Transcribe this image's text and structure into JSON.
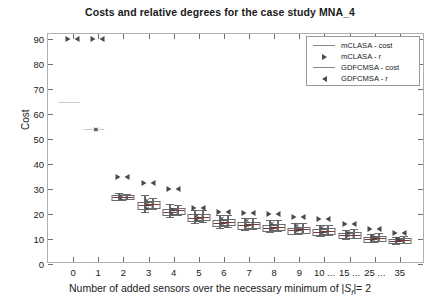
{
  "chart_data": {
    "type": "boxplot",
    "title": "Costs and relative degrees for the case study MNA_4",
    "xlabel": "Number of added sensors over the necessary minimum of |S_f|= 2",
    "xlabel_parts": {
      "pre": "Number of added sensors over the necessary minimum of |",
      "sym": "S",
      "sub": "f",
      "post": "|= 2"
    },
    "ylabel": "Cost",
    "ylim": [
      0,
      92
    ],
    "yticks": [
      0,
      10,
      20,
      30,
      40,
      50,
      60,
      70,
      80,
      90
    ],
    "categories": [
      "0",
      "1",
      "2",
      "3",
      "4",
      "5",
      "6",
      "7",
      "8",
      "9",
      "10",
      "15",
      "25",
      "35"
    ],
    "xtick_labels": [
      "0",
      "1",
      "2",
      "3",
      "4",
      "5",
      "6",
      "7",
      "8",
      "9",
      "10 ...",
      "15 ...",
      "25 ...",
      "35"
    ],
    "grid": false,
    "legend_position": "top-right",
    "legend": [
      {
        "label": "mCLASA - cost",
        "symbol": "line"
      },
      {
        "label": "mCLASA - r",
        "symbol": "triangle-right"
      },
      {
        "label": "GDFCMSA - cost",
        "symbol": "line"
      },
      {
        "label": "GDFCMSA - r",
        "symbol": "triangle-left"
      }
    ],
    "series": [
      {
        "name": "mCLASA - cost",
        "type": "box",
        "boxes": [
          {
            "x": "0",
            "median": 65.0,
            "q1": 65.0,
            "q3": 65.0,
            "low": 65.0,
            "high": 65.0
          },
          {
            "x": "1",
            "median": 54.0,
            "q1": 54.0,
            "q3": 54.0,
            "low": 54.0,
            "high": 54.0
          },
          {
            "x": "2",
            "median": 27.0,
            "q1": 26.2,
            "q3": 27.6,
            "low": 25.5,
            "high": 28.5
          },
          {
            "x": "3",
            "median": 23.5,
            "q1": 22.4,
            "q3": 25.0,
            "low": 21.0,
            "high": 27.5
          },
          {
            "x": "4",
            "median": 21.0,
            "q1": 20.0,
            "q3": 22.0,
            "low": 19.0,
            "high": 24.0
          },
          {
            "x": "5",
            "median": 18.5,
            "q1": 17.5,
            "q3": 20.0,
            "low": 16.5,
            "high": 21.5
          },
          {
            "x": "6",
            "median": 16.5,
            "q1": 15.5,
            "q3": 17.8,
            "low": 14.5,
            "high": 19.5
          },
          {
            "x": "7",
            "median": 15.5,
            "q1": 14.5,
            "q3": 16.8,
            "low": 13.5,
            "high": 18.5
          },
          {
            "x": "8",
            "median": 14.5,
            "q1": 13.6,
            "q3": 15.6,
            "low": 12.8,
            "high": 17.5
          },
          {
            "x": "9",
            "median": 13.5,
            "q1": 12.6,
            "q3": 14.6,
            "low": 12.0,
            "high": 16.5
          },
          {
            "x": "10",
            "median": 13.0,
            "q1": 12.0,
            "q3": 14.0,
            "low": 11.2,
            "high": 15.5
          },
          {
            "x": "15",
            "median": 11.5,
            "q1": 10.8,
            "q3": 12.4,
            "low": 10.0,
            "high": 13.5
          },
          {
            "x": "25",
            "median": 10.0,
            "q1": 9.4,
            "q3": 10.8,
            "low": 9.0,
            "high": 12.0
          },
          {
            "x": "35",
            "median": 9.2,
            "q1": 8.7,
            "q3": 10.0,
            "low": 8.2,
            "high": 11.0
          }
        ]
      },
      {
        "name": "GDFCMSA - cost",
        "type": "box",
        "boxes": [
          {
            "x": "2",
            "median": 27.0,
            "q1": 26.5,
            "q3": 27.5,
            "low": 26.0,
            "high": 28.0
          },
          {
            "x": "3",
            "median": 24.0,
            "q1": 23.0,
            "q3": 25.2,
            "low": 22.0,
            "high": 26.5
          },
          {
            "x": "4",
            "median": 21.5,
            "q1": 20.5,
            "q3": 22.5,
            "low": 19.5,
            "high": 23.5
          },
          {
            "x": "5",
            "median": 19.0,
            "q1": 18.0,
            "q3": 20.2,
            "low": 17.0,
            "high": 21.5
          },
          {
            "x": "6",
            "median": 17.0,
            "q1": 16.0,
            "q3": 18.2,
            "low": 15.0,
            "high": 19.5
          },
          {
            "x": "7",
            "median": 16.0,
            "q1": 15.0,
            "q3": 17.0,
            "low": 14.0,
            "high": 18.5
          },
          {
            "x": "8",
            "median": 15.0,
            "q1": 14.0,
            "q3": 16.0,
            "low": 13.2,
            "high": 17.5
          },
          {
            "x": "9",
            "median": 14.0,
            "q1": 13.0,
            "q3": 15.0,
            "low": 12.4,
            "high": 16.5
          },
          {
            "x": "10",
            "median": 13.4,
            "q1": 12.4,
            "q3": 14.4,
            "low": 11.6,
            "high": 15.8
          },
          {
            "x": "15",
            "median": 11.8,
            "q1": 11.0,
            "q3": 12.8,
            "low": 10.4,
            "high": 14.0
          },
          {
            "x": "25",
            "median": 10.4,
            "q1": 9.8,
            "q3": 11.2,
            "low": 9.2,
            "high": 12.4
          },
          {
            "x": "35",
            "median": 9.6,
            "q1": 9.0,
            "q3": 10.4,
            "low": 8.5,
            "high": 11.4
          }
        ]
      },
      {
        "name": "mCLASA - r",
        "type": "marker",
        "marker": "triangle-right",
        "points": [
          {
            "x": "0",
            "y": 90.0
          },
          {
            "x": "1",
            "y": 90.0
          },
          {
            "x": "2",
            "y": 35.0
          },
          {
            "x": "3",
            "y": 32.5
          },
          {
            "x": "4",
            "y": 30.0
          },
          {
            "x": "5",
            "y": 22.5
          },
          {
            "x": "6",
            "y": 21.0
          },
          {
            "x": "7",
            "y": 20.5
          },
          {
            "x": "8",
            "y": 20.0
          },
          {
            "x": "9",
            "y": 19.0
          },
          {
            "x": "10",
            "y": 18.0
          },
          {
            "x": "15",
            "y": 16.0
          },
          {
            "x": "25",
            "y": 14.0
          },
          {
            "x": "35",
            "y": 12.5
          }
        ]
      },
      {
        "name": "GDFCMSA - r",
        "type": "marker",
        "marker": "triangle-left",
        "points": [
          {
            "x": "0",
            "y": 90.0
          },
          {
            "x": "1",
            "y": 90.0
          },
          {
            "x": "2",
            "y": 35.0
          },
          {
            "x": "3",
            "y": 32.5
          },
          {
            "x": "4",
            "y": 30.0
          },
          {
            "x": "5",
            "y": 22.5
          },
          {
            "x": "6",
            "y": 21.0
          },
          {
            "x": "7",
            "y": 20.5
          },
          {
            "x": "8",
            "y": 20.0
          },
          {
            "x": "9",
            "y": 19.0
          },
          {
            "x": "10",
            "y": 18.0
          },
          {
            "x": "15",
            "y": 16.0
          },
          {
            "x": "25",
            "y": 14.0
          },
          {
            "x": "35",
            "y": 12.5
          }
        ]
      },
      {
        "name": "outliers",
        "type": "scatter",
        "marker": "x",
        "points": [
          {
            "x": "1",
            "y": 54.0
          },
          {
            "x": "1",
            "y": 54.0
          },
          {
            "x": "2",
            "y": 27.5
          },
          {
            "x": "2",
            "y": 26.5
          },
          {
            "x": "3",
            "y": 25.5
          },
          {
            "x": "3",
            "y": 24.0
          },
          {
            "x": "3",
            "y": 22.5
          },
          {
            "x": "4",
            "y": 22.0
          },
          {
            "x": "4",
            "y": 20.5
          },
          {
            "x": "5",
            "y": 19.5
          },
          {
            "x": "5",
            "y": 18.0
          },
          {
            "x": "6",
            "y": 18.5
          },
          {
            "x": "6",
            "y": 16.5
          },
          {
            "x": "7",
            "y": 17.5
          },
          {
            "x": "7",
            "y": 15.5
          },
          {
            "x": "8",
            "y": 16.5
          },
          {
            "x": "8",
            "y": 14.5
          },
          {
            "x": "9",
            "y": 15.5
          },
          {
            "x": "9",
            "y": 13.5
          },
          {
            "x": "10",
            "y": 15.0
          },
          {
            "x": "10",
            "y": 13.0
          },
          {
            "x": "15",
            "y": 13.0
          },
          {
            "x": "15",
            "y": 11.5
          },
          {
            "x": "25",
            "y": 11.5
          },
          {
            "x": "25",
            "y": 10.0
          },
          {
            "x": "35",
            "y": 10.5
          },
          {
            "x": "35",
            "y": 9.5
          }
        ]
      }
    ]
  }
}
